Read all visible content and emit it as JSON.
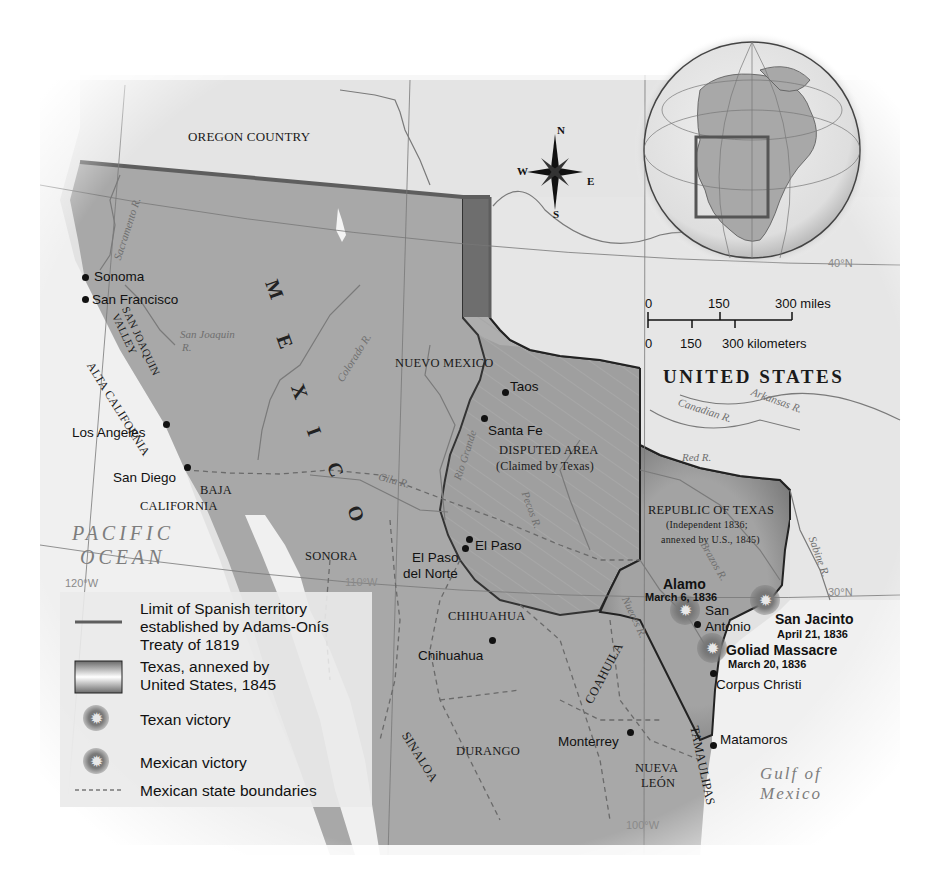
{
  "map": {
    "title_hidden": "Texas Independence and Annexation",
    "colors": {
      "mexico_fill": "#a9a9a9",
      "texas_fill": "#9a9a9a",
      "disputed_fill": "#a4a4a4",
      "us_fill": "#e4e4e4",
      "ocean_fill": "#f0f0f0",
      "border_dark": "#5a5a5a",
      "adams_onis_line": "#5e5e5e"
    }
  },
  "regions": {
    "oregon_country": "OREGON COUNTRY",
    "united_states": "UNITED STATES",
    "nuevo_mexico": "NUEVO MEXICO",
    "disputed_area": "DISPUTED AREA",
    "disputed_area_note": "(Claimed by Texas)",
    "republic_of_texas": "REPUBLIC OF TEXAS",
    "republic_note_1": "(Independent 1836;",
    "republic_note_2": "annexed by U.S., 1845)",
    "alta_california": "ALTA CALIFORNIA",
    "san_joaquin_valley_1": "SAN JOAQUIN",
    "san_joaquin_valley_2": "VALLEY",
    "baja_california_1": "BAJA",
    "baja_california_2": "CALIFORNIA",
    "sonora": "SONORA",
    "chihuahua_state": "CHIHUAHUA",
    "coahuila": "COAHUILA",
    "sinaloa": "SINALOA",
    "durango": "DURANGO",
    "nueva_leon_1": "NUEVA",
    "nueva_leon_2": "LEÓN",
    "tamaulipas": "TAMAULIPAS",
    "mexico_letters": [
      "M",
      "E",
      "X",
      "I",
      "C",
      "O"
    ]
  },
  "water": {
    "pacific_1": "PACIFIC",
    "pacific_2": "OCEAN",
    "gulf_1": "Gulf of",
    "gulf_2": "Mexico"
  },
  "rivers": {
    "sacramento": "Sacramento R.",
    "san_joaquin": "San Joaquin",
    "san_joaquin_r": "R.",
    "colorado": "Colorado R.",
    "rio_grande": "Rio Grande",
    "gila": "Gila R.",
    "pecos": "Pecos R.",
    "canadian": "Canadian R.",
    "arkansas": "Arkansas R.",
    "red": "Red R.",
    "brazos": "Brazos R.",
    "nueces": "Nueces R.",
    "sabine": "Sabine R."
  },
  "cities": [
    {
      "name": "Sonoma"
    },
    {
      "name": "San Francisco"
    },
    {
      "name": "Los  Angeles"
    },
    {
      "name": "San Diego"
    },
    {
      "name": "Taos"
    },
    {
      "name": "Santa Fe"
    },
    {
      "name": "El Paso"
    },
    {
      "name": "El Paso"
    },
    {
      "name": "del Norte"
    },
    {
      "name": "Chihuahua"
    },
    {
      "name": "San"
    },
    {
      "name": "Antonio"
    },
    {
      "name": "Corpus Christi"
    },
    {
      "name": "Monterrey"
    },
    {
      "name": "Matamoros"
    }
  ],
  "battles": [
    {
      "name": "Alamo",
      "date": "March 6, 1836",
      "result": "Mexican victory"
    },
    {
      "name": "San Jacinto",
      "date": "April 21, 1836",
      "result": "Texan victory"
    },
    {
      "name": "Goliad Massacre",
      "date": "March 20, 1836",
      "result": "Mexican victory"
    }
  ],
  "grid": {
    "lat_40": "40°N",
    "lat_30": "30°N",
    "lon_120": "120°W",
    "lon_110": "110°W",
    "lon_100": "100°W"
  },
  "compass": {
    "n": "N",
    "s": "S",
    "e": "E",
    "w": "W"
  },
  "scale": {
    "miles_0": "0",
    "miles_150": "150",
    "miles_300": "300 miles",
    "km_0": "0",
    "km_150": "150",
    "km_300": "300 kilometers"
  },
  "legend": {
    "items": [
      {
        "label_1": "Limit of Spanish territory",
        "label_2": "established by Adams-Onís",
        "label_3": "Treaty of 1819",
        "symbol": "solid-line"
      },
      {
        "label_1": "Texas, annexed by",
        "label_2": "United States, 1845",
        "symbol": "shaded-box"
      },
      {
        "label_1": "Texan victory",
        "symbol": "burst-icon"
      },
      {
        "label_1": "Mexican victory",
        "symbol": "burst-icon"
      },
      {
        "label_1": "Mexican state boundaries",
        "symbol": "dashed-line"
      }
    ]
  },
  "locator_globe": {
    "highlight": "western North America"
  }
}
